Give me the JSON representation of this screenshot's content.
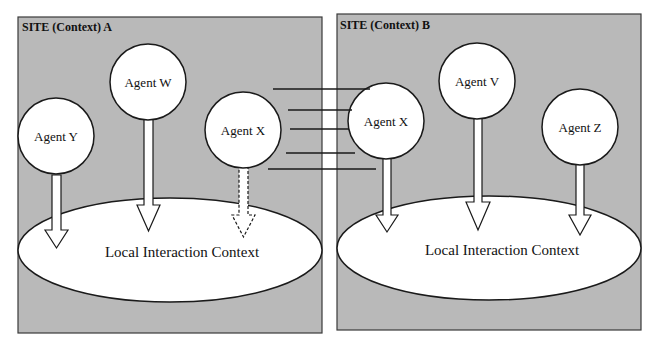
{
  "diagram": {
    "sites": [
      {
        "id": "A",
        "title": "SITE (Context) A",
        "context_label": "Local Interaction Context",
        "agents": [
          {
            "name": "Agent Y",
            "arrow": "solid"
          },
          {
            "name": "Agent W",
            "arrow": "solid"
          },
          {
            "name": "Agent X",
            "arrow": "dashed"
          }
        ]
      },
      {
        "id": "B",
        "title": "SITE (Context) B",
        "context_label": "Local Interaction Context",
        "agents": [
          {
            "name": "Agent X",
            "arrow": "solid"
          },
          {
            "name": "Agent V",
            "arrow": "solid"
          },
          {
            "name": "Agent Z",
            "arrow": "solid"
          }
        ]
      }
    ],
    "connections": {
      "from": "Agent X (Site A)",
      "to": "Agent X (Site B)",
      "line_count": 5
    },
    "colors": {
      "site_background": "#b9b9b9",
      "shape_fill": "#ffffff",
      "stroke": "#1a1a1a"
    }
  }
}
